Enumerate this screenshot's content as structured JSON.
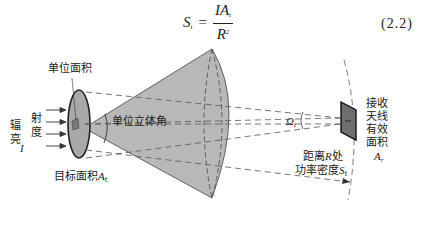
{
  "formula": {
    "lhs": "S",
    "lhs_sub": "t",
    "equals": "=",
    "numerator": "IA",
    "numerator_sub": "t",
    "denominator": "R",
    "denominator_sup": "2",
    "equation_number": "(2.2)"
  },
  "labels": {
    "unit_area": "单位面积",
    "radiance_col1_line1": "辐",
    "radiance_col1_line2": "亮",
    "radiance_col2_line1": "射",
    "radiance_col2_line2": "度",
    "radiance_symbol": "I",
    "unit_solid_angle": "单位立体角",
    "target_area": "目标面积",
    "target_area_symbol": "A",
    "target_area_sub": "t",
    "omega_symbol": "Ω",
    "omega_sub": "t",
    "distance_line1_prefix": "距离",
    "distance_symbol": "R",
    "distance_line1_suffix": "处",
    "power_density_text": "功率密度",
    "power_density_symbol": "S",
    "power_density_sub": "t",
    "receiver_line1": "接收",
    "receiver_line2": "天线",
    "receiver_line3": "有效",
    "receiver_line4": "面积",
    "receiver_symbol": "A",
    "receiver_sub": "r"
  },
  "colors": {
    "cone_fill": "#b8b8b8",
    "ellipse_fill": "#a9a9a9",
    "receiver_fill": "#6f6f6f",
    "stroke": "#333333",
    "dash": "#555555"
  }
}
